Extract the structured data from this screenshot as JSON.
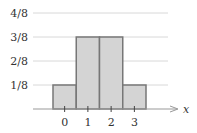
{
  "chart_data": {
    "type": "bar",
    "title": "",
    "xlabel": "x",
    "ylabel": "",
    "categories": [
      "0",
      "1",
      "2",
      "3"
    ],
    "values": [
      0.125,
      0.375,
      0.375,
      0.125
    ],
    "value_labels": [
      "1/8",
      "3/8",
      "3/8",
      "1/8"
    ],
    "y_ticks": [
      {
        "value": 0.125,
        "label": "1/8"
      },
      {
        "value": 0.25,
        "label": "2/8"
      },
      {
        "value": 0.375,
        "label": "3/8"
      },
      {
        "value": 0.5,
        "label": "4/8"
      }
    ],
    "ylim": [
      0,
      0.5
    ],
    "grid": true,
    "legend": null,
    "bar_style": "histogram (adjacent bars, no gaps)"
  },
  "colors": {
    "bar_fill": "#d4d4d4",
    "bar_stroke": "#777777",
    "grid": "#d8d8d8",
    "axis": "#999999",
    "text": "#333333"
  }
}
